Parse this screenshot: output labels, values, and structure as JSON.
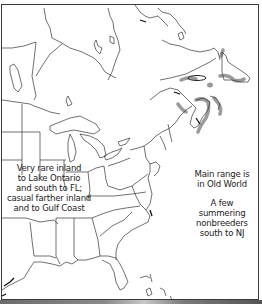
{
  "map": {
    "region": "Eastern North America",
    "range_shading_color": "#8a8a8a",
    "outline_color": "#333333",
    "background_color": "#ffffff"
  },
  "annotations": {
    "inland": {
      "lines": [
        "Very rare inland",
        "to Lake Ontario",
        "and south to FL;",
        "casual farther inland",
        "and to Gulf Coast"
      ]
    },
    "main_range": {
      "lines": [
        "Main range is",
        "in Old World"
      ]
    },
    "summering": {
      "lines": [
        "A few summering",
        "nonbreeders",
        "south to NJ"
      ]
    }
  }
}
